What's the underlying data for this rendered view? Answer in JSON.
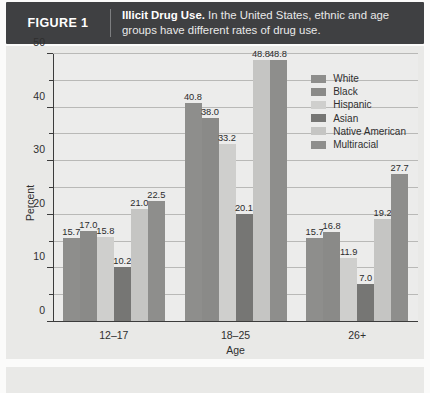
{
  "header": {
    "figure_label": "FIGURE 1",
    "caption_bold": "Illicit Drug Use.",
    "caption_rest": " In the United States, ethnic and age groups have different rates of drug use."
  },
  "chart_data": {
    "type": "bar",
    "title": "Illicit Drug Use",
    "xlabel": "Age",
    "ylabel": "Percent",
    "ylim": [
      0,
      50
    ],
    "yticks": [
      0,
      10,
      20,
      30,
      40,
      50
    ],
    "yticks_minor": [
      5,
      15,
      25,
      35,
      45
    ],
    "grid": true,
    "legend_position": "top-right-inside",
    "categories": [
      "12–17",
      "18–25",
      "26+"
    ],
    "series": [
      {
        "name": "White",
        "color": "#8e8e8c",
        "values": [
          15.7,
          40.8,
          15.7
        ]
      },
      {
        "name": "Black",
        "color": "#8a8a88",
        "values": [
          17.0,
          38.0,
          16.8
        ]
      },
      {
        "name": "Hispanic",
        "color": "#cfcfcd",
        "values": [
          15.8,
          33.2,
          11.9
        ]
      },
      {
        "name": "Asian",
        "color": "#767674",
        "values": [
          10.2,
          20.1,
          7.0
        ]
      },
      {
        "name": "Native American",
        "color": "#c5c5c3",
        "values": [
          21.0,
          48.8,
          19.2
        ]
      },
      {
        "name": "Multiracial",
        "color": "#8e8e8c",
        "values": [
          22.5,
          48.8,
          27.7
        ]
      }
    ]
  },
  "colors": {
    "header_bg": "#3f4042",
    "plot_bg": "#ececeb",
    "grid": "#b9b9b7",
    "axis": "#3c3c3c"
  }
}
